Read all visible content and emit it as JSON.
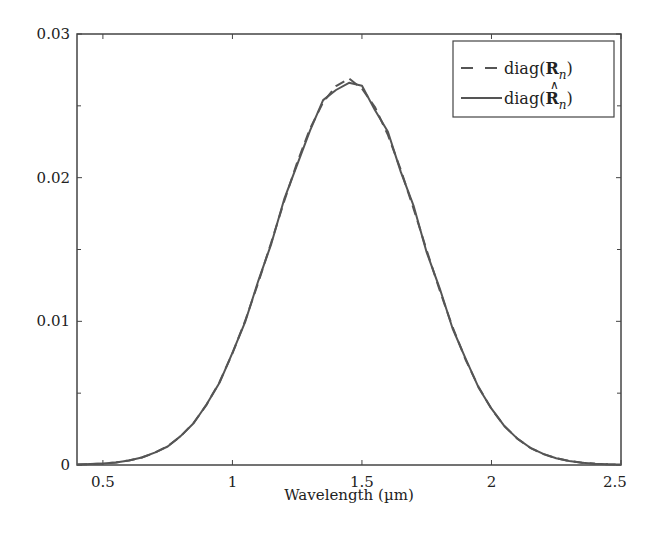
{
  "chart_data": {
    "type": "line",
    "title": "",
    "xlabel": "Wavelength (µm)",
    "ylabel": "",
    "xlim": [
      0.4,
      2.5
    ],
    "ylim": [
      0,
      0.03
    ],
    "grid": false,
    "legend_position": "upper right",
    "x_ticks": [
      {
        "value": 0.5,
        "label": "0.5"
      },
      {
        "value": 1.0,
        "label": "1"
      },
      {
        "value": 1.5,
        "label": "1.5"
      },
      {
        "value": 2.0,
        "label": "2"
      },
      {
        "value": 2.5,
        "label": "2.5"
      }
    ],
    "y_ticks": [
      {
        "value": 0,
        "label": "0"
      },
      {
        "value": 0.01,
        "label": "0.01"
      },
      {
        "value": 0.02,
        "label": "0.02"
      },
      {
        "value": 0.03,
        "label": "0.03"
      }
    ],
    "x": [
      0.4,
      0.45,
      0.5,
      0.55,
      0.6,
      0.65,
      0.7,
      0.75,
      0.8,
      0.85,
      0.9,
      0.95,
      1.0,
      1.05,
      1.1,
      1.15,
      1.2,
      1.25,
      1.3,
      1.35,
      1.4,
      1.45,
      1.5,
      1.55,
      1.6,
      1.65,
      1.7,
      1.75,
      1.8,
      1.85,
      1.9,
      1.95,
      2.0,
      2.05,
      2.1,
      2.15,
      2.2,
      2.25,
      2.3,
      2.35,
      2.4,
      2.45,
      2.5
    ],
    "series": [
      {
        "name": "diag(R_n)",
        "style": "dashed",
        "color": "#555555",
        "values": [
          3e-05,
          6e-05,
          0.0001,
          0.00018,
          0.00031,
          0.00052,
          0.00084,
          0.00131,
          0.00199,
          0.00293,
          0.00418,
          0.00578,
          0.00776,
          0.01008,
          0.0127,
          0.01551,
          0.01836,
          0.02106,
          0.02342,
          0.02524,
          0.02637,
          0.0269,
          0.0262,
          0.02492,
          0.02298,
          0.02054,
          0.01779,
          0.01494,
          0.01216,
          0.00959,
          0.00733,
          0.00544,
          0.0039,
          0.00272,
          0.00183,
          0.0012,
          0.00076,
          0.00047,
          0.00028,
          0.00016,
          9e-05,
          5e-05,
          3e-05
        ]
      },
      {
        "name": "diag(R̂_n)",
        "style": "solid",
        "color": "#555555",
        "values": [
          3e-05,
          6e-05,
          0.0001,
          0.00018,
          0.00031,
          0.00052,
          0.00086,
          0.00129,
          0.00201,
          0.0029,
          0.00421,
          0.00572,
          0.00781,
          0.01,
          0.01282,
          0.0154,
          0.0185,
          0.0209,
          0.0233,
          0.0254,
          0.0261,
          0.0266,
          0.0264,
          0.0247,
          0.0232,
          0.0204,
          0.018,
          0.0148,
          0.0123,
          0.0095,
          0.0074,
          0.0054,
          0.00392,
          0.0027,
          0.00184,
          0.0012,
          0.00077,
          0.00047,
          0.00028,
          0.00016,
          9e-05,
          5e-05,
          3e-05
        ]
      }
    ]
  },
  "legend": {
    "items": [
      {
        "prefix": "diag(",
        "symbol": "R",
        "subscript": "n",
        "suffix": ")",
        "hat": false
      },
      {
        "prefix": "diag(",
        "symbol": "R",
        "subscript": "n",
        "suffix": ")",
        "hat": true
      }
    ]
  }
}
